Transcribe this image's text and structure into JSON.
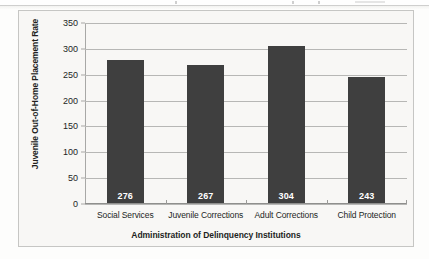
{
  "chart_data": {
    "type": "bar",
    "title": "",
    "categories": [
      "Social Services",
      "Juvenile Corrections",
      "Adult Corrections",
      "Child Protection"
    ],
    "values": [
      276,
      267,
      304,
      243
    ],
    "data_labels": [
      "276",
      "267",
      "304",
      "243"
    ],
    "xlabel": "Administration of Delinquency Institutions",
    "ylabel": "Juvenile Out-of-Home Placement Rate",
    "ylim": [
      0,
      350
    ],
    "y_ticks": [
      0,
      50,
      100,
      150,
      200,
      250,
      300,
      350
    ],
    "y_tick_labels": [
      "0",
      "50",
      "100",
      "150",
      "200",
      "250",
      "300",
      "350"
    ],
    "grid": true,
    "legend": false,
    "series": [
      {
        "name": "Juvenile Out-of-Home Placement Rate",
        "values": [
          276,
          267,
          304,
          243
        ]
      }
    ],
    "colors": {
      "bar_fill": "#3f3f3f",
      "gridline": "#b7b7b5",
      "axis_line": "#8f8f8d",
      "plot_background": "#f8f7f5",
      "frame_border": "#c6c6c4",
      "data_label_text": "#ffffff",
      "axis_text": "#231f1e"
    }
  }
}
